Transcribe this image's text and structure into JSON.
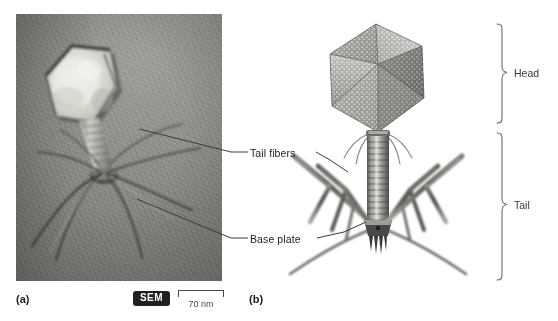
{
  "figure": {
    "panels": [
      {
        "letter": "(a)",
        "kind": "sem-micrograph",
        "subject": "bacteriophage",
        "imaging_badge": "SEM",
        "scale_bar": {
          "label": "70 nm"
        },
        "callouts": [
          {
            "id": "tail-fibers",
            "label": "Tail fibers"
          },
          {
            "id": "base-plate",
            "label": "Base plate"
          }
        ]
      },
      {
        "letter": "(b)",
        "kind": "3d-model",
        "subject": "bacteriophage",
        "brackets": [
          {
            "id": "head",
            "label": "Head"
          },
          {
            "id": "tail",
            "label": "Tail"
          }
        ]
      }
    ]
  },
  "colors": {
    "background": "#ffffff",
    "badge_fill": "#231f20",
    "badge_text": "#ffffff",
    "label_text": "#1d1d1b",
    "bracket_text": "#3a3a38",
    "scalebar": "#4a4a48",
    "model_gray_light": "#c9c9c6",
    "model_gray_mid": "#8f8f8c",
    "model_gray_dark": "#4e4e4c",
    "micrograph_gray": "#8c8c88"
  }
}
